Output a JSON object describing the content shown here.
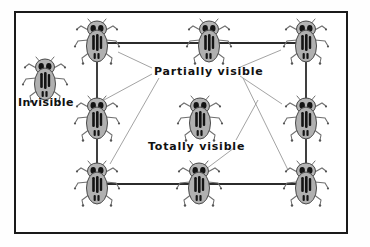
{
  "diagram": {
    "title_present": false,
    "frame": {
      "border_color": "#1a1a1a",
      "background": "#ffffff"
    },
    "labels": [
      {
        "id": "invisible",
        "text": "Invisible",
        "x": 18,
        "y": 97
      },
      {
        "id": "partially",
        "text": "Partially visible",
        "x": 154,
        "y": 66
      },
      {
        "id": "totally",
        "text": "Totally visible",
        "x": 148,
        "y": 141
      }
    ],
    "figure_icon_name": "bug-icon",
    "figure_colors": {
      "body_fill": "#b0b0b0",
      "body_outline": "#4a4a4a",
      "marking": "#1a1a1a",
      "leg": "#666666"
    },
    "connector_color": "#2b2b2b",
    "leader_color": "#8c8c8c",
    "bugs": [
      {
        "id": "bug-invisible-left",
        "role": "invisible",
        "x": 22,
        "y": 54
      },
      {
        "id": "bug-top-left",
        "role": "partially-visible",
        "x": 74,
        "y": 16
      },
      {
        "id": "bug-top-center",
        "role": "partially-visible",
        "x": 186,
        "y": 16
      },
      {
        "id": "bug-top-right",
        "role": "partially-visible",
        "x": 283,
        "y": 16
      },
      {
        "id": "bug-middle-left",
        "role": "partially-visible",
        "x": 74,
        "y": 93
      },
      {
        "id": "bug-center",
        "role": "totally-visible",
        "x": 177,
        "y": 93
      },
      {
        "id": "bug-middle-right",
        "role": "partially-visible",
        "x": 283,
        "y": 93
      },
      {
        "id": "bug-bottom-left",
        "role": "partially-visible",
        "x": 74,
        "y": 158
      },
      {
        "id": "bug-bottom-center",
        "role": "partially-visible",
        "x": 176,
        "y": 158
      },
      {
        "id": "bug-bottom-right",
        "role": "partially-visible",
        "x": 283,
        "y": 158
      }
    ],
    "connectors": [
      {
        "from": "bug-top-left",
        "to": "bug-top-center",
        "x1": 98,
        "y1": 43,
        "x2": 203,
        "y2": 43
      },
      {
        "from": "bug-top-center",
        "to": "bug-top-right",
        "x1": 203,
        "y1": 43,
        "x2": 306,
        "y2": 43
      },
      {
        "from": "bug-top-left",
        "to": "bug-bottom-left",
        "x1": 97,
        "y1": 43,
        "x2": 97,
        "y2": 184
      },
      {
        "from": "bug-top-right",
        "to": "bug-bottom-right",
        "x1": 306,
        "y1": 43,
        "x2": 306,
        "y2": 184
      },
      {
        "from": "bug-bottom-left",
        "to": "bug-bottom-center",
        "x1": 97,
        "y1": 184,
        "x2": 200,
        "y2": 184
      },
      {
        "from": "bug-bottom-center",
        "to": "bug-bottom-right",
        "x1": 200,
        "y1": 184,
        "x2": 306,
        "y2": 184
      }
    ],
    "leaders": [
      {
        "label": "partially",
        "x1": 152,
        "y1": 68,
        "x2": 118,
        "y2": 52
      },
      {
        "label": "partially",
        "x1": 152,
        "y1": 74,
        "x2": 104,
        "y2": 100
      },
      {
        "label": "partially",
        "x1": 159,
        "y1": 78,
        "x2": 110,
        "y2": 164
      },
      {
        "label": "partially",
        "x1": 238,
        "y1": 68,
        "x2": 281,
        "y2": 50
      },
      {
        "label": "partially",
        "x1": 240,
        "y1": 76,
        "x2": 282,
        "y2": 104
      },
      {
        "label": "partially",
        "x1": 243,
        "y1": 78,
        "x2": 288,
        "y2": 170
      },
      {
        "label": "totally",
        "x1": 236,
        "y1": 140,
        "x2": 258,
        "y2": 100
      },
      {
        "label": "totally",
        "x1": 234,
        "y1": 148,
        "x2": 202,
        "y2": 172
      }
    ]
  }
}
